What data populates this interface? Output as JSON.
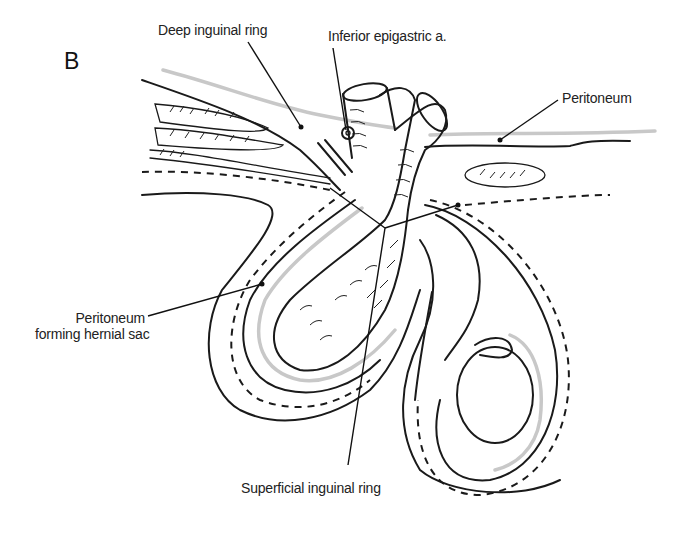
{
  "figure": {
    "panel_letter": "B",
    "labels": {
      "deep_inguinal_ring": "Deep inguinal ring",
      "inferior_epigastric": "Inferior epigastric a.",
      "peritoneum_top": "Peritoneum",
      "peritoneum_sac_line1": "Peritoneum",
      "peritoneum_sac_line2": "forming hernial sac",
      "superficial_inguinal_ring": "Superficial inguinal ring"
    },
    "colors": {
      "ink": "#1a1a1a",
      "peritoneum_grey": "#c8c8c8",
      "background": "#ffffff"
    }
  }
}
